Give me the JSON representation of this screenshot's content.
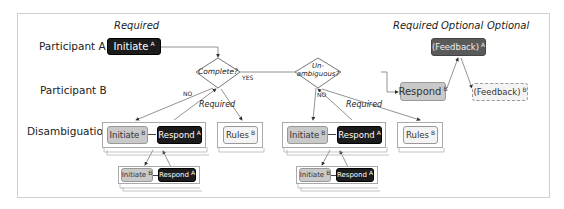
{
  "columns": {
    "required_left": "Required",
    "required_right": "Required",
    "optional_1": "Optional",
    "optional_2": "Optional"
  },
  "rows": {
    "participant_a": "Participant A",
    "participant_b": "Participant B",
    "disambiguation": "Disambiguation"
  },
  "nodes": {
    "initiate_a": {
      "label": "Initiate",
      "sup": "A"
    },
    "complete": {
      "label": "Complete?"
    },
    "unambiguous": {
      "label_1": "Un-",
      "label_2": "ambiguous?"
    },
    "respond_b": {
      "label": "Respond",
      "sup": "B"
    },
    "feedback_a": {
      "label": "(Feedback)",
      "sup": "A"
    },
    "feedback_b": {
      "label": "(Feedback)",
      "sup": "B"
    },
    "d1_initiate": {
      "label": "Initiate",
      "sup": "B"
    },
    "d1_respond": {
      "label": "Respond",
      "sup": "A"
    },
    "d1_rules": {
      "label": "Rules",
      "sup": "B"
    },
    "d1_sub_initiate": {
      "label": "Initiate",
      "sup": "B"
    },
    "d1_sub_respond": {
      "label": "Respond",
      "sup": "A"
    },
    "d2_initiate": {
      "label": "Initiate",
      "sup": "B"
    },
    "d2_respond": {
      "label": "Respond",
      "sup": "A"
    },
    "d2_rules": {
      "label": "Rules",
      "sup": "B"
    },
    "d2_sub_initiate": {
      "label": "Initiate",
      "sup": "B"
    },
    "d2_sub_respond": {
      "label": "Respond",
      "sup": "A"
    }
  },
  "edge_labels": {
    "yes": "YES",
    "no_1": "NO",
    "no_2": "NO",
    "required_1": "Required",
    "required_2": "Required"
  },
  "colors": {
    "dark": "#1c1c1c",
    "dark_gray": "#5a5a5a",
    "gray": "#c9c9c9",
    "light": "#f4f4f4",
    "frame": "#d0d0d0"
  }
}
